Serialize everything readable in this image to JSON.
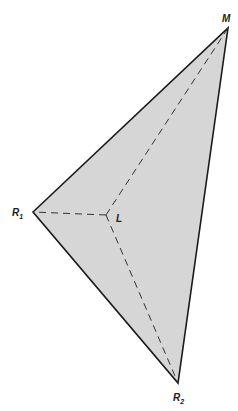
{
  "diagram": {
    "type": "triangle-with-internal-point",
    "fill_color": "#d6d6d6",
    "edge_color": "#1a1a1a",
    "vertices": {
      "R1": {
        "label": "R",
        "sub": "1",
        "x": 33,
        "y": 212
      },
      "M": {
        "label": "M",
        "sub": "",
        "x": 228,
        "y": 28
      },
      "R2": {
        "label": "R",
        "sub": "2",
        "x": 178,
        "y": 383
      },
      "L": {
        "label": "L",
        "sub": "",
        "x": 106,
        "y": 215
      }
    },
    "solid_edges": [
      [
        "R1",
        "M"
      ],
      [
        "M",
        "R2"
      ],
      [
        "R2",
        "R1"
      ]
    ],
    "dashed_edges": [
      [
        "L",
        "R1"
      ],
      [
        "L",
        "M"
      ],
      [
        "L",
        "R2"
      ]
    ]
  }
}
